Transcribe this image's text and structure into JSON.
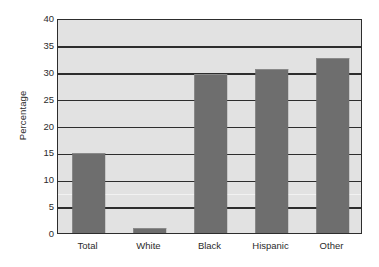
{
  "chart_data": {
    "type": "bar",
    "title": "",
    "subtitle": "",
    "xlabel": "",
    "ylabel": "Percentage",
    "categories": [
      "Total",
      "White",
      "Black",
      "Hispanic",
      "Other"
    ],
    "values": [
      14.8,
      1.0,
      29.6,
      30.5,
      32.5
    ],
    "ylim": [
      0,
      40
    ],
    "ytick_labels": [
      "0",
      "5",
      "10",
      "15",
      "20",
      "25",
      "30",
      "35",
      "40"
    ],
    "ytick_values": [
      0,
      5,
      10,
      15,
      20,
      25,
      30,
      35,
      40
    ],
    "grid": "horizontal",
    "legend": "none",
    "annotations": [],
    "colors": {
      "bar_fill": "#6e6e6e",
      "bar_top_highlight": "#8a8a8a",
      "plot_background": "#e2e2e2",
      "axis_line": "#2d2d2d",
      "gridline": "#2d2d2d",
      "text": "#2b2b2b",
      "page_background": "#ffffff"
    }
  }
}
